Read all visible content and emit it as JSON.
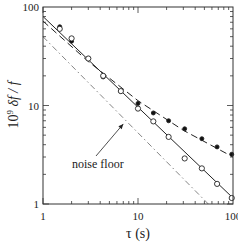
{
  "chart_data": {
    "type": "scatter",
    "title": "",
    "xlabel": "τ (s)",
    "ylabel_parts": {
      "prefix": "10",
      "exponent": "9",
      "rest": " δf / f"
    },
    "xscale": "log",
    "yscale": "log",
    "xlim": [
      1,
      100
    ],
    "ylim": [
      1,
      100
    ],
    "x_tick_labels": [
      {
        "value": 1,
        "label": "1"
      },
      {
        "value": 10,
        "label": "10"
      },
      {
        "value": 100,
        "label": "100"
      }
    ],
    "y_tick_labels": [
      {
        "value": 1,
        "label": "1"
      },
      {
        "value": 10,
        "label": "10"
      },
      {
        "value": 100,
        "label": "100"
      }
    ],
    "grid": false,
    "series": [
      {
        "name": "filled points",
        "marker": "filled-circle",
        "x": [
          1.5,
          2,
          3,
          4.3,
          6.6,
          10,
          14.5,
          21,
          31,
          47,
          68,
          97
        ],
        "y": [
          63,
          45,
          30,
          19.5,
          14,
          10.5,
          8.4,
          7.0,
          5.8,
          4.6,
          3.8,
          3.2
        ]
      },
      {
        "name": "open points",
        "marker": "open-circle",
        "x": [
          1.5,
          2,
          3,
          4.3,
          6.6,
          10,
          14.5,
          21,
          31,
          47,
          68,
          97
        ],
        "y": [
          60,
          48,
          30,
          20,
          14,
          9.3,
          6.9,
          4.8,
          2.9,
          2.3,
          1.6,
          1.15
        ]
      },
      {
        "name": "solid fit",
        "style": "solid",
        "x": [
          1,
          100
        ],
        "y": [
          80,
          1.15
        ]
      },
      {
        "name": "dashed fit",
        "style": "dashed",
        "x": [
          1,
          3,
          10,
          30,
          100
        ],
        "y": [
          72,
          28,
          11.2,
          5.6,
          3.0
        ]
      },
      {
        "name": "noise floor",
        "style": "dash-dot",
        "x": [
          1,
          55
        ],
        "y": [
          50,
          1
        ]
      }
    ],
    "annotations": [
      {
        "text": "noise floor",
        "points_to_series": "noise floor",
        "arrow_target": {
          "x": 7.0,
          "y": 6.5
        }
      }
    ]
  }
}
